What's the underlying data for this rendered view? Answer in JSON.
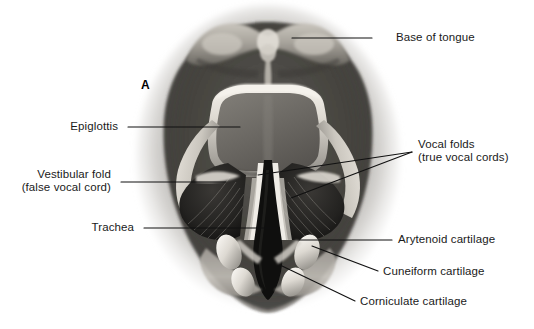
{
  "figure": {
    "panel_letter": "A",
    "background_color": "#ffffff",
    "text_color": "#1a1a1a",
    "leader_line_color": "#111111"
  },
  "labels": [
    {
      "id": "base-of-tongue",
      "name": "Base of tongue",
      "lines": [
        "Base of tongue"
      ],
      "side": "right",
      "x": 396,
      "y": 31,
      "leader": {
        "x1": 372,
        "y1": 38,
        "x2": 292,
        "y2": 38
      }
    },
    {
      "id": "epiglottis",
      "name": "Epiglottis",
      "lines": [
        "Epiglottis"
      ],
      "side": "left",
      "x": 72,
      "y": 120,
      "leader": {
        "x1": 128,
        "y1": 127,
        "x2": 240,
        "y2": 127
      }
    },
    {
      "id": "vocal-folds",
      "name": "Vocal folds (true vocal cords)",
      "lines": [
        "Vocal folds",
        "(true vocal cords)"
      ],
      "side": "right",
      "x": 418,
      "y": 138,
      "leader_a": {
        "x1": 412,
        "y1": 152,
        "x2": 258,
        "y2": 175
      },
      "leader_b": {
        "x1": 412,
        "y1": 152,
        "x2": 291,
        "y2": 198
      }
    },
    {
      "id": "vestibular-fold",
      "name": "Vestibular fold (false vocal cord)",
      "lines": [
        "Vestibular fold",
        "(false vocal cord)"
      ],
      "side": "left",
      "x": 28,
      "y": 168,
      "leader": {
        "x1": 121,
        "y1": 182,
        "x2": 226,
        "y2": 182
      }
    },
    {
      "id": "trachea",
      "name": "Trachea",
      "lines": [
        "Trachea"
      ],
      "side": "left",
      "x": 94,
      "y": 221,
      "leader": {
        "x1": 144,
        "y1": 228,
        "x2": 277,
        "y2": 228
      }
    },
    {
      "id": "arytenoid-cartilage",
      "name": "Arytenoid cartilage",
      "lines": [
        "Arytenoid cartilage"
      ],
      "side": "right",
      "x": 398,
      "y": 233,
      "leader": {
        "x1": 392,
        "y1": 240,
        "x2": 300,
        "y2": 240
      }
    },
    {
      "id": "cuneiform-cartilage",
      "name": "Cuneiform cartilage",
      "lines": [
        "Cuneiform cartilage"
      ],
      "side": "right",
      "x": 383,
      "y": 265,
      "leader": {
        "x1": 378,
        "y1": 271,
        "x2": 312,
        "y2": 246
      }
    },
    {
      "id": "corniculate-cartilage",
      "name": "Corniculate cartilage",
      "lines": [
        "Corniculate cartilage"
      ],
      "side": "right",
      "x": 360,
      "y": 295,
      "leader": {
        "x1": 355,
        "y1": 301,
        "x2": 280,
        "y2": 265
      }
    }
  ],
  "anatomy": {
    "structures": [
      "base of tongue",
      "vallecula",
      "epiglottis",
      "aryepiglottic fold",
      "vestibular fold",
      "vocal fold",
      "rima glottidis",
      "trachea",
      "arytenoid cartilage",
      "cuneiform cartilage",
      "corniculate cartilage"
    ],
    "palette": {
      "airway_dark": "#141414",
      "mucosa_mid": "#6d6d6d",
      "mucosa_light": "#d9d5d0",
      "highlight": "#f2efe9",
      "vignette": "#8d8a86"
    }
  }
}
